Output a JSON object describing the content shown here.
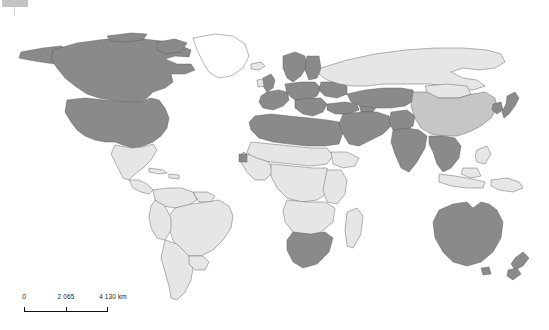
{
  "figure": {
    "kind": "world-choropleth-map",
    "projection_note": "equirectangular world map",
    "background_color": "#ffffff",
    "frame_color": "#d6d6d6"
  },
  "scalebar": {
    "name": "map-scale-bar",
    "labels": [
      "0",
      "2 065",
      "4 130 km"
    ],
    "tick_values": [
      0,
      2065,
      4130
    ],
    "unit": "km"
  },
  "shading": {
    "legend_shown": false,
    "classes": [
      {
        "key": "none",
        "color": "#ffffff",
        "label": "no data"
      },
      {
        "key": "low",
        "color": "#e6e6e6",
        "label": "low"
      },
      {
        "key": "medium",
        "color": "#c6c6c6",
        "label": "medium"
      },
      {
        "key": "high",
        "color": "#8a8a8a",
        "label": "high"
      }
    ],
    "border_color": "#5a5a5a"
  },
  "regions": [
    {
      "name": "canada",
      "class": "high"
    },
    {
      "name": "united-states",
      "class": "high"
    },
    {
      "name": "greenland",
      "class": "none"
    },
    {
      "name": "mexico",
      "class": "low"
    },
    {
      "name": "central-america",
      "class": "low"
    },
    {
      "name": "caribbean",
      "class": "low"
    },
    {
      "name": "south-america",
      "class": "low"
    },
    {
      "name": "north-africa",
      "class": "high"
    },
    {
      "name": "sub-saharan-africa",
      "class": "low"
    },
    {
      "name": "south-africa",
      "class": "high"
    },
    {
      "name": "madagascar",
      "class": "low"
    },
    {
      "name": "western-europe",
      "class": "high"
    },
    {
      "name": "eastern-europe",
      "class": "high"
    },
    {
      "name": "russia",
      "class": "low"
    },
    {
      "name": "central-asia",
      "class": "high"
    },
    {
      "name": "middle-east",
      "class": "high"
    },
    {
      "name": "india",
      "class": "high"
    },
    {
      "name": "china",
      "class": "medium"
    },
    {
      "name": "mongolia",
      "class": "low"
    },
    {
      "name": "southeast-asia",
      "class": "high"
    },
    {
      "name": "japan",
      "class": "high"
    },
    {
      "name": "korea",
      "class": "high"
    },
    {
      "name": "indonesia",
      "class": "low"
    },
    {
      "name": "australia",
      "class": "high"
    },
    {
      "name": "new-zealand",
      "class": "high"
    }
  ]
}
